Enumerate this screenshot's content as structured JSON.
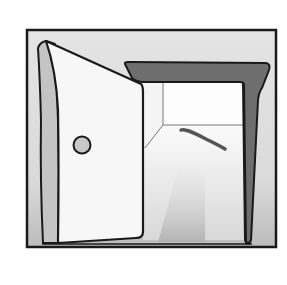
{
  "illustration": {
    "subject": "open-door",
    "colors": {
      "background": "#ffffff",
      "panel_bg": "#d9d9d9",
      "outline": "#1a1a1a",
      "door_face": "#f7f7f7",
      "door_edge": "#c4c4c4",
      "door_frame": "#6e6e6e",
      "room_wall": "#fbfbfb",
      "room_floor_light": "#efefef",
      "light_beam": "#bdbdbd",
      "knob": "#c8c8c8",
      "floor_shadow": "#555555"
    }
  }
}
